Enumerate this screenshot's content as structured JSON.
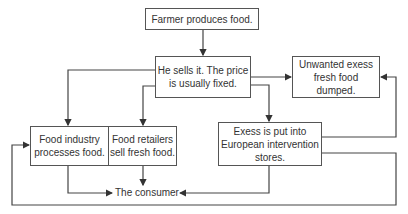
{
  "diagram": {
    "type": "flowchart",
    "nodes": {
      "farmer": "Farmer produces food.",
      "sells_line1": "He sells it. The price",
      "sells_line2": "is usually fixed.",
      "unwanted_line1": "Unwanted exess",
      "unwanted_line2": "fresh food dumped.",
      "industry_line1": "Food industry",
      "industry_line2": "processes food.",
      "retailers_line1": "Food retailers",
      "retailers_line2": "sell fresh food.",
      "intervention_line1": "Exess is put into",
      "intervention_line2": "European intervention",
      "intervention_line3": "stores.",
      "consumer": "The consumer"
    },
    "edges": [
      {
        "from": "farmer",
        "to": "sells"
      },
      {
        "from": "sells",
        "to": "industry"
      },
      {
        "from": "sells",
        "to": "retailers"
      },
      {
        "from": "sells",
        "to": "unwanted"
      },
      {
        "from": "sells",
        "to": "intervention"
      },
      {
        "from": "intervention",
        "to": "unwanted"
      },
      {
        "from": "intervention",
        "to": "industry"
      },
      {
        "from": "industry",
        "to": "consumer"
      },
      {
        "from": "retailers",
        "to": "consumer"
      },
      {
        "from": "intervention",
        "to": "consumer"
      }
    ],
    "colors": {
      "line": "#444444",
      "border": "#555555",
      "text": "#333333"
    }
  }
}
